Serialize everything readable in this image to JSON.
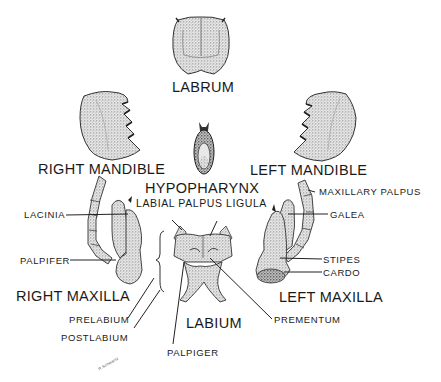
{
  "figure": {
    "parts": {
      "labrum": "LABRUM",
      "right_mandible": "RIGHT MANDIBLE",
      "left_mandible": "LEFT MANDIBLE",
      "hypopharynx": "HYPOPHARYNX",
      "right_maxilla": "RIGHT MAXILLA",
      "left_maxilla": "LEFT MAXILLA",
      "labium": "LABIUM"
    },
    "callouts": {
      "labial_palpus": "LABIAL PALPUS",
      "ligula": "LIGULA",
      "maxillary_palpus": "MAXILLARY PALPUS",
      "lacinia": "LACINIA",
      "galea": "GALEA",
      "palpifer": "PALPIFER",
      "stipes": "STIPES",
      "cardo": "CARDO",
      "prelabium": "PRELABIUM",
      "postlabium": "POSTLABIUM",
      "prementum": "PREMENTUM",
      "palpiger": "PALPIGER"
    },
    "signature": "R.Schwartz",
    "colors": {
      "ink": "#1a1a1a",
      "stipple": "#8a8a8a",
      "background": "#ffffff"
    }
  }
}
